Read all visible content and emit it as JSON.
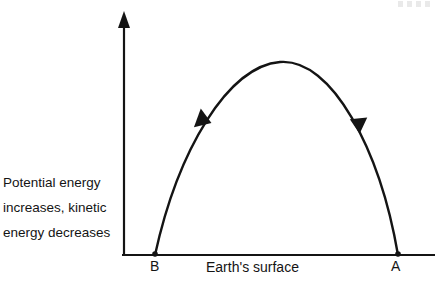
{
  "figure": {
    "type": "projectile-trajectory-diagram",
    "caption_lines": [
      "Potential energy",
      "increases, kinetic",
      "energy decreases"
    ],
    "baseline_label": "Earth's surface",
    "points": [
      {
        "id": "B",
        "label": "B",
        "x": 155,
        "y": 255,
        "role": "landing-point"
      },
      {
        "id": "A",
        "label": "A",
        "x": 398,
        "y": 255,
        "role": "launch-point"
      }
    ],
    "apex": {
      "x": 280,
      "y": 62
    },
    "arrows": [
      {
        "id": "descending",
        "x": 203,
        "y": 120,
        "direction": "down-left",
        "angle_deg": 237
      },
      {
        "id": "ascending",
        "x": 358,
        "y": 123,
        "direction": "up-left",
        "angle_deg": 302
      }
    ],
    "axes": {
      "vertical": {
        "x": 124,
        "y_top": 12,
        "y_bottom": 255,
        "has_arrowhead": true
      },
      "horizontal": {
        "y": 255,
        "x_left": 122,
        "x_right": 435,
        "has_arrowhead": false
      }
    },
    "colors": {
      "ink": "#141414",
      "background": "#ffffff"
    }
  }
}
